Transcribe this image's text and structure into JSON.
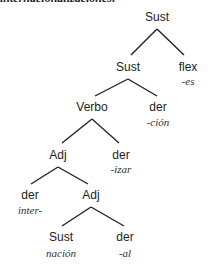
{
  "caption": "internacionalizaciones:",
  "tree": {
    "root": {
      "label": "Sust"
    },
    "sust2": {
      "label": "Sust"
    },
    "flex": {
      "label": "flex",
      "morph": "-es"
    },
    "verbo": {
      "label": "Verbo"
    },
    "der_cion": {
      "label": "der",
      "morph": "-ción"
    },
    "adj1": {
      "label": "Adj"
    },
    "der_izar": {
      "label": "der",
      "morph": "-izar"
    },
    "der_inter": {
      "label": "der",
      "morph": "inter-"
    },
    "adj2": {
      "label": "Adj"
    },
    "sust_nacion": {
      "label": "Sust",
      "morph": "nación"
    },
    "der_al": {
      "label": "der",
      "morph": "-al"
    }
  },
  "colors": {
    "line": "#222222",
    "text": "#222222"
  }
}
